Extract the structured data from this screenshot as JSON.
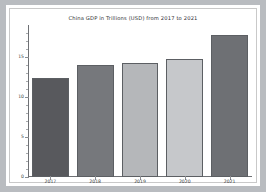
{
  "figure": {
    "background": "#ffffff",
    "page_background": "#b9bcc0",
    "frame_color": "#c9c9c9"
  },
  "chart_data": {
    "type": "bar",
    "title": "China GDP in Trillions  (USD) from  2017  to  2021",
    "xlabel": "",
    "ylabel": "",
    "categories": [
      "2017",
      "2018",
      "2019",
      "2020",
      "2021"
    ],
    "values": [
      12.4,
      14.0,
      14.3,
      14.7,
      17.7
    ],
    "ylim": [
      0,
      19
    ],
    "ytick_labels": [
      "0",
      "5",
      "10",
      "15"
    ],
    "ytick_values": [
      0,
      5,
      10,
      15
    ],
    "yminor_values": [
      1,
      2,
      3,
      4,
      6,
      7,
      8,
      9,
      11,
      12,
      13,
      14,
      16,
      17,
      18
    ],
    "grid": false,
    "legend": null,
    "bar_colors": [
      "#58595d",
      "#76787c",
      "#b5b7ba",
      "#c6c8cb",
      "#6e7074"
    ],
    "bar_edge_color": "#5c5f63",
    "axis_color": "#6e7074",
    "tick_label_color": "#3d3f42",
    "title_color": "#2e3033"
  }
}
